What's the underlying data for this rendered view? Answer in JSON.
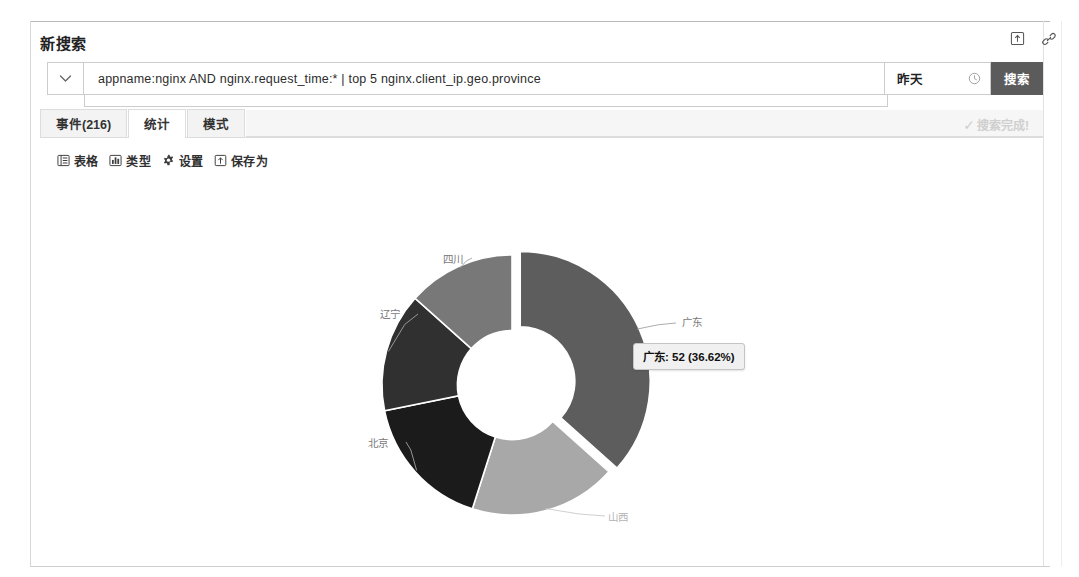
{
  "header": {
    "title": "新搜索",
    "icons": [
      {
        "name": "export-icon",
        "glyph": "export"
      },
      {
        "name": "link-icon",
        "glyph": "link"
      }
    ]
  },
  "search": {
    "dropdown_icon": "chevron-down-icon",
    "query": "appname:nginx  AND  nginx.request_time:*  | top 5 nginx.client_ip.geo.province",
    "placeholder": "",
    "time_range": "昨天",
    "time_icon": "clock-icon",
    "search_button": "搜索"
  },
  "tabs": [
    {
      "label": "事件(216)",
      "name": "tab-events",
      "active": false
    },
    {
      "label": "统计",
      "name": "tab-statistics",
      "active": true
    },
    {
      "label": "模式",
      "name": "tab-patterns",
      "active": false
    }
  ],
  "status": {
    "check": "✓",
    "text": "搜索完成!"
  },
  "toolbar": [
    {
      "label": "表格",
      "icon": "table-icon",
      "name": "toolbar-table"
    },
    {
      "label": "类型",
      "icon": "chart-type-icon",
      "name": "toolbar-chart-type"
    },
    {
      "label": "设置",
      "icon": "gear-icon",
      "name": "toolbar-settings"
    },
    {
      "label": "保存为",
      "icon": "save-icon",
      "name": "toolbar-save-as"
    }
  ],
  "tooltip": {
    "text": "广东: 52 (36.62%)"
  },
  "chart_data": {
    "type": "pie",
    "variant": "donut",
    "title": "",
    "legend": "none",
    "labels_position": "outside-leader-lines",
    "total": 142,
    "inner_radius_ratio": 0.42,
    "exploded_slice": "广东",
    "categories": [
      "广东",
      "山西",
      "北京",
      "辽宁",
      "四川"
    ],
    "values": [
      52,
      26,
      24,
      21,
      19
    ],
    "percents": [
      36.62,
      18.31,
      16.9,
      14.79,
      13.38
    ],
    "colors": [
      "#5d5d5d",
      "#a8a8a8",
      "#1b1b1b",
      "#303030",
      "#787878"
    ],
    "slices": [
      {
        "label": "广东",
        "value": 52,
        "percent": 36.62,
        "color": "#5d5d5d",
        "exploded": true
      },
      {
        "label": "山西",
        "value": 26,
        "percent": 18.31,
        "color": "#a8a8a8",
        "exploded": false
      },
      {
        "label": "北京",
        "value": 24,
        "percent": 16.9,
        "color": "#1b1b1b",
        "exploded": false
      },
      {
        "label": "辽宁",
        "value": 21,
        "percent": 14.79,
        "color": "#303030",
        "exploded": false
      },
      {
        "label": "四川",
        "value": 19,
        "percent": 13.38,
        "color": "#787878",
        "exploded": false
      }
    ]
  }
}
